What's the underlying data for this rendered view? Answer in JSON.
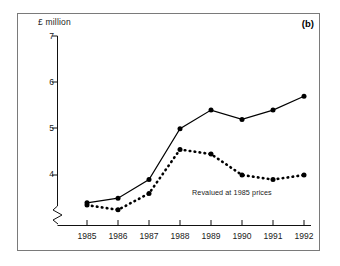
{
  "figure": {
    "panel_label": "(b)",
    "background_color": "#ffffff",
    "frame_color": "#7a7a7a",
    "ink_color": "#000000"
  },
  "chart_data": {
    "type": "line",
    "title": "",
    "subtitle": "",
    "xlabel": "",
    "ylabel": "£ million",
    "categories": [
      "1985",
      "1986",
      "1987",
      "1988",
      "1989",
      "1990",
      "1991",
      "1992"
    ],
    "x": [
      1985,
      1986,
      1987,
      1988,
      1989,
      1990,
      1991,
      1992
    ],
    "xlim": [
      1984.6,
      1992.6
    ],
    "ylim": [
      3.1,
      7.0
    ],
    "yticks": [
      4,
      5,
      6,
      7
    ],
    "ytick_labels": [
      "4",
      "5",
      "6",
      "7"
    ],
    "y_axis_broken": true,
    "y_axis_break_note": "zigzag break between origin and first tick",
    "grid": false,
    "legend": "none",
    "series": [
      {
        "name": "Current prices",
        "style": "solid-line-with-markers",
        "marker": "filled-circle",
        "color": "#000000",
        "values": [
          3.4,
          3.5,
          3.9,
          5.0,
          5.4,
          5.2,
          5.4,
          5.7
        ]
      },
      {
        "name": "Revalued at 1985 prices",
        "style": "dotted-line-with-markers",
        "marker": "filled-circle",
        "color": "#000000",
        "values": [
          3.35,
          3.25,
          3.6,
          4.55,
          4.45,
          4.0,
          3.9,
          4.0
        ]
      }
    ],
    "annotations": [
      {
        "text": "Revalued at 1985 prices",
        "x": 1990.0,
        "y": 3.62,
        "target_series": "Revalued at 1985 prices"
      }
    ]
  }
}
